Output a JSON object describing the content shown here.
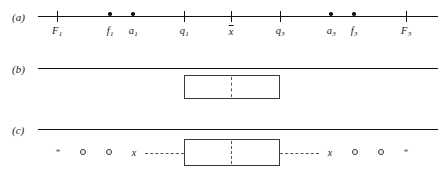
{
  "figure": {
    "type": "boxplot-construction-diagram",
    "width": 443,
    "height": 172,
    "background": "#ffffff",
    "line_color": "#111111",
    "dash_color": "#555555"
  },
  "panels": [
    {
      "id": "a",
      "label": "(a)",
      "label_x": 12,
      "label_y": 11,
      "axis": {
        "x": 38,
        "y": 16,
        "length": 400
      },
      "ticks": [
        {
          "name": "lower-inner-fence",
          "x": 57,
          "label": "F",
          "sub": "1",
          "kind": "tick"
        },
        {
          "name": "lower-adjacent-f1",
          "x": 110,
          "label": "f",
          "sub": "1",
          "kind": "dot"
        },
        {
          "name": "lower-adjacent-a1",
          "x": 133,
          "label": "a",
          "sub": "1",
          "kind": "dot"
        },
        {
          "name": "first-quartile",
          "x": 184,
          "label": "q",
          "sub": "1",
          "kind": "tick"
        },
        {
          "name": "median",
          "x": 231,
          "label": "x",
          "sub": "",
          "kind": "tick",
          "overbar": true
        },
        {
          "name": "third-quartile",
          "x": 280,
          "label": "q",
          "sub": "3",
          "kind": "tick"
        },
        {
          "name": "upper-adjacent-a3",
          "x": 331,
          "label": "a",
          "sub": "3",
          "kind": "dot"
        },
        {
          "name": "upper-adjacent-f3",
          "x": 354,
          "label": "f",
          "sub": "3",
          "kind": "dot"
        },
        {
          "name": "upper-inner-fence",
          "x": 406,
          "label": "F",
          "sub": "3",
          "kind": "tick"
        }
      ]
    },
    {
      "id": "b",
      "label": "(b)",
      "label_x": 12,
      "label_y": 63,
      "axis": {
        "x": 38,
        "y": 68,
        "length": 400
      },
      "box": {
        "left": 184,
        "right": 280,
        "top": 75,
        "bottom": 99
      },
      "median_x": 231,
      "whiskers": [],
      "markers": []
    },
    {
      "id": "c",
      "label": "(c)",
      "label_x": 12,
      "label_y": 124,
      "axis": {
        "x": 38,
        "y": 129,
        "length": 400
      },
      "box": {
        "left": 184,
        "right": 280,
        "top": 139,
        "bottom": 166
      },
      "median_x": 231,
      "whiskers": [
        {
          "name": "left-whisker",
          "from": 145,
          "to": 184
        },
        {
          "name": "right-whisker",
          "from": 280,
          "to": 319
        }
      ],
      "markers": [
        {
          "name": "far-outside-left",
          "glyph": "*",
          "x": 58,
          "y": 152
        },
        {
          "name": "outside-left-2",
          "glyph": "o",
          "x": 83,
          "y": 152
        },
        {
          "name": "outside-left-1",
          "glyph": "o",
          "x": 109,
          "y": 152
        },
        {
          "name": "whisker-end-left",
          "glyph": "x",
          "x": 134,
          "y": 152
        },
        {
          "name": "whisker-end-right",
          "glyph": "x",
          "x": 330,
          "y": 152
        },
        {
          "name": "outside-right-1",
          "glyph": "o",
          "x": 355,
          "y": 152
        },
        {
          "name": "outside-right-2",
          "glyph": "o",
          "x": 381,
          "y": 152
        },
        {
          "name": "far-outside-right",
          "glyph": "*",
          "x": 406,
          "y": 152
        }
      ]
    }
  ]
}
